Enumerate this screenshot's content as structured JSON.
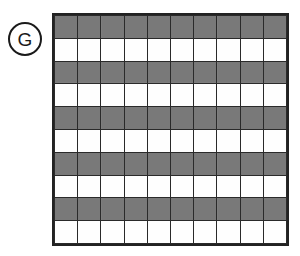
{
  "figure": {
    "label": {
      "text": "G",
      "shape": "circle",
      "icon_name": "circled-letter-label"
    },
    "colors": {
      "shaded_fill": "#757575",
      "blank_fill": "#ffffff",
      "grid_line": "#2a2a2a",
      "border": "#222222",
      "label_stroke": "#1a1a1a",
      "background": "#ffffff"
    }
  },
  "chart_data": {
    "type": "heatmap",
    "title": "",
    "subtitle": "",
    "xlabel": "",
    "ylabel": "",
    "legend": [],
    "annotations": [
      "G"
    ],
    "grid": true,
    "columns": 10,
    "rows": 10,
    "pattern": "alternating-horizontal-stripes",
    "row_labels": [
      "1",
      "2",
      "3",
      "4",
      "5",
      "6",
      "7",
      "8",
      "9",
      "10"
    ],
    "column_labels": [
      "1",
      "2",
      "3",
      "4",
      "5",
      "6",
      "7",
      "8",
      "9",
      "10"
    ],
    "row_states": [
      "shaded",
      "blank",
      "shaded",
      "blank",
      "shaded",
      "blank",
      "shaded",
      "blank",
      "shaded",
      "blank"
    ],
    "shaded_fraction": "50%",
    "values": [
      [
        1,
        1,
        1,
        1,
        1,
        1,
        1,
        1,
        1,
        1
      ],
      [
        0,
        0,
        0,
        0,
        0,
        0,
        0,
        0,
        0,
        0
      ],
      [
        1,
        1,
        1,
        1,
        1,
        1,
        1,
        1,
        1,
        1
      ],
      [
        0,
        0,
        0,
        0,
        0,
        0,
        0,
        0,
        0,
        0
      ],
      [
        1,
        1,
        1,
        1,
        1,
        1,
        1,
        1,
        1,
        1
      ],
      [
        0,
        0,
        0,
        0,
        0,
        0,
        0,
        0,
        0,
        0
      ],
      [
        1,
        1,
        1,
        1,
        1,
        1,
        1,
        1,
        1,
        1
      ],
      [
        0,
        0,
        0,
        0,
        0,
        0,
        0,
        0,
        0,
        0
      ],
      [
        1,
        1,
        1,
        1,
        1,
        1,
        1,
        1,
        1,
        1
      ],
      [
        0,
        0,
        0,
        0,
        0,
        0,
        0,
        0,
        0,
        0
      ]
    ]
  }
}
